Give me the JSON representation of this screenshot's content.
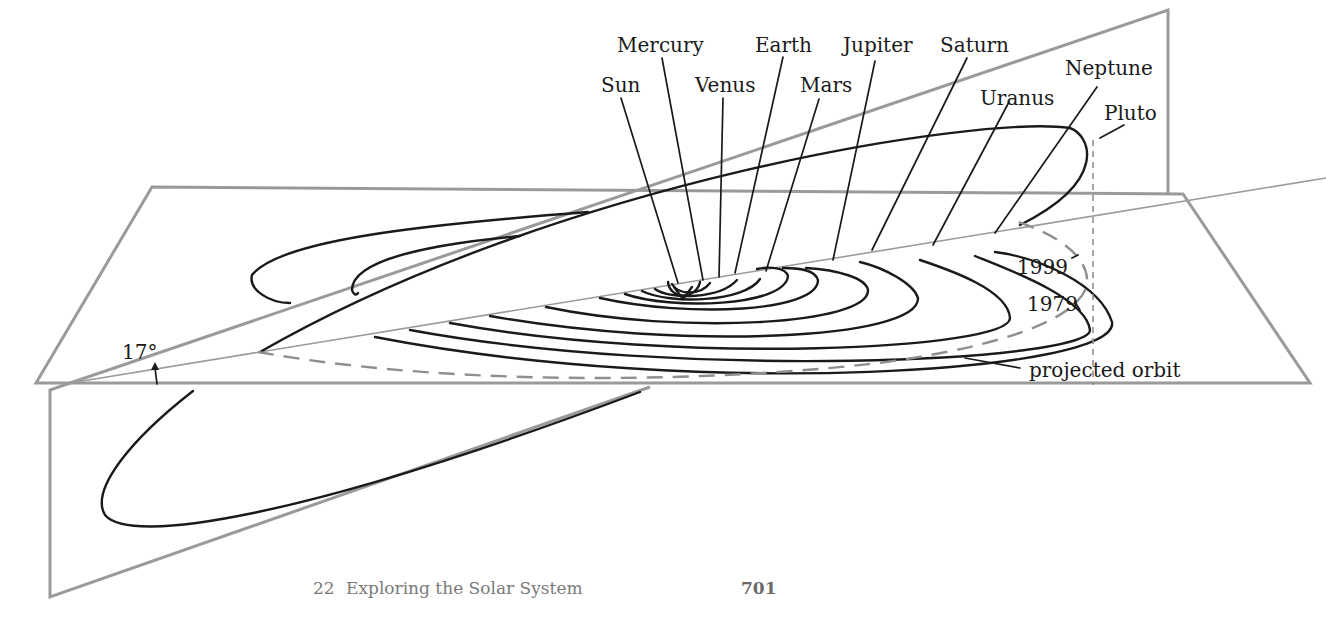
{
  "figure": {
    "type": "3d-orbit-diagram",
    "planet_labels": [
      {
        "name": "Sun"
      },
      {
        "name": "Mercury"
      },
      {
        "name": "Venus"
      },
      {
        "name": "Earth"
      },
      {
        "name": "Mars"
      },
      {
        "name": "Jupiter"
      },
      {
        "name": "Saturn"
      },
      {
        "name": "Uranus"
      },
      {
        "name": "Neptune"
      },
      {
        "name": "Pluto"
      }
    ],
    "annotations": {
      "inclination_angle": "17°",
      "year_crossing_a": "1999",
      "year_crossing_b": "1979",
      "projected_orbit": "projected orbit"
    },
    "colors": {
      "plane_outline": "#9a9a9a",
      "orbit_line": "#1a1a1a",
      "projected_dashes": "#8f8f8f",
      "footer_text": "#7a7a7a"
    }
  },
  "footer": {
    "chapter_number": "22",
    "chapter_title": "Exploring the Solar System",
    "page_number": "701"
  }
}
